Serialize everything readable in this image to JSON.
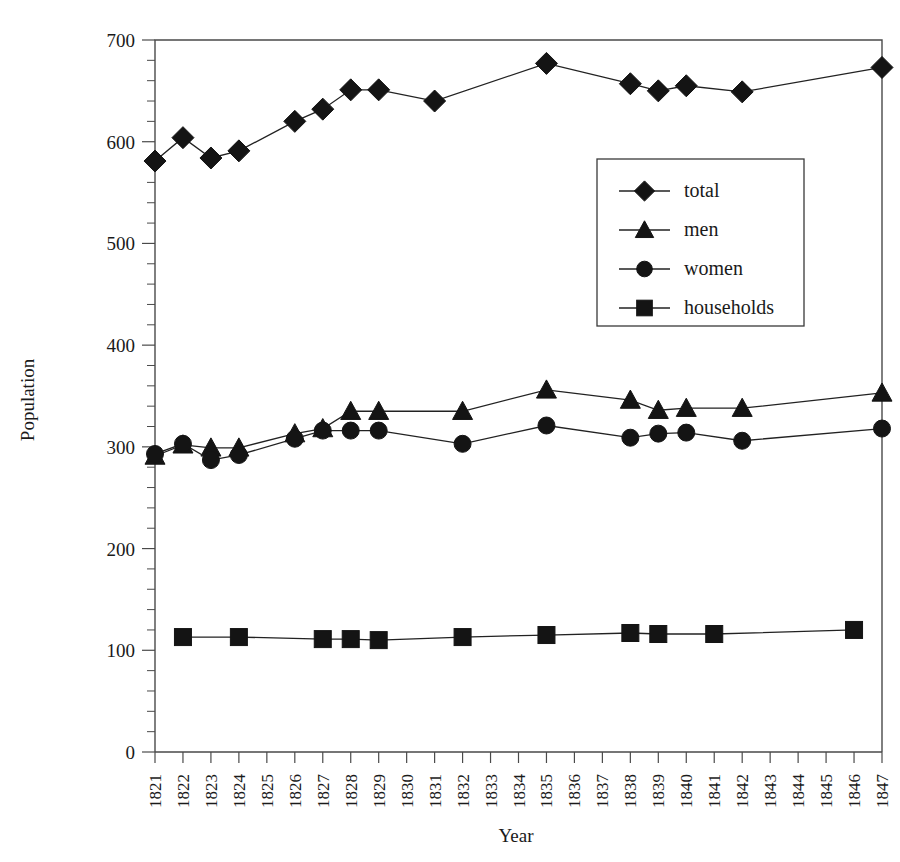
{
  "chart_data": {
    "type": "line",
    "title": "",
    "xlabel": "Year",
    "ylabel": "Population",
    "xlim": [
      1821,
      1847
    ],
    "ylim": [
      0,
      700
    ],
    "y_ticks": [
      0,
      100,
      200,
      300,
      400,
      500,
      600,
      700
    ],
    "y_tick_labels": [
      "0",
      "100",
      "200",
      "300",
      "400",
      "500",
      "600",
      "700"
    ],
    "y_minor_tick_step": 20,
    "x_ticks": [
      1821,
      1822,
      1823,
      1824,
      1825,
      1826,
      1827,
      1828,
      1829,
      1830,
      1831,
      1832,
      1833,
      1834,
      1835,
      1836,
      1837,
      1838,
      1839,
      1840,
      1841,
      1842,
      1843,
      1844,
      1845,
      1846,
      1847
    ],
    "x_tick_labels": [
      "1821",
      "1822",
      "1823",
      "1824",
      "1825",
      "1826",
      "1827",
      "1828",
      "1829",
      "1830",
      "1831",
      "1832",
      "1833",
      "1834",
      "1835",
      "1836",
      "1837",
      "1838",
      "1839",
      "1840",
      "1841",
      "1842",
      "1843",
      "1844",
      "1845",
      "1846",
      "1847"
    ],
    "x_tick_rotation": 90,
    "grid": false,
    "legend_position": "center-right",
    "series": [
      {
        "name": "total",
        "marker": "diamond",
        "points": [
          {
            "x": 1821,
            "y": 581
          },
          {
            "x": 1822,
            "y": 604
          },
          {
            "x": 1823,
            "y": 584
          },
          {
            "x": 1824,
            "y": 591
          },
          {
            "x": 1826,
            "y": 620
          },
          {
            "x": 1827,
            "y": 632
          },
          {
            "x": 1828,
            "y": 651
          },
          {
            "x": 1829,
            "y": 651
          },
          {
            "x": 1831,
            "y": 640
          },
          {
            "x": 1835,
            "y": 677
          },
          {
            "x": 1838,
            "y": 657
          },
          {
            "x": 1839,
            "y": 650
          },
          {
            "x": 1840,
            "y": 655
          },
          {
            "x": 1842,
            "y": 649
          },
          {
            "x": 1847,
            "y": 673
          }
        ]
      },
      {
        "name": "men",
        "marker": "triangle",
        "points": [
          {
            "x": 1821,
            "y": 291
          },
          {
            "x": 1822,
            "y": 302
          },
          {
            "x": 1823,
            "y": 299
          },
          {
            "x": 1824,
            "y": 299
          },
          {
            "x": 1826,
            "y": 313
          },
          {
            "x": 1827,
            "y": 318
          },
          {
            "x": 1828,
            "y": 335
          },
          {
            "x": 1829,
            "y": 335
          },
          {
            "x": 1832,
            "y": 335
          },
          {
            "x": 1835,
            "y": 356
          },
          {
            "x": 1838,
            "y": 346
          },
          {
            "x": 1839,
            "y": 336
          },
          {
            "x": 1840,
            "y": 338
          },
          {
            "x": 1842,
            "y": 338
          },
          {
            "x": 1847,
            "y": 353
          }
        ]
      },
      {
        "name": "women",
        "marker": "circle",
        "points": [
          {
            "x": 1821,
            "y": 293
          },
          {
            "x": 1822,
            "y": 303
          },
          {
            "x": 1823,
            "y": 287
          },
          {
            "x": 1824,
            "y": 292
          },
          {
            "x": 1826,
            "y": 308
          },
          {
            "x": 1827,
            "y": 316
          },
          {
            "x": 1828,
            "y": 316
          },
          {
            "x": 1829,
            "y": 316
          },
          {
            "x": 1832,
            "y": 303
          },
          {
            "x": 1835,
            "y": 321
          },
          {
            "x": 1838,
            "y": 309
          },
          {
            "x": 1839,
            "y": 313
          },
          {
            "x": 1840,
            "y": 314
          },
          {
            "x": 1842,
            "y": 306
          },
          {
            "x": 1847,
            "y": 318
          }
        ]
      },
      {
        "name": "households",
        "marker": "square",
        "points": [
          {
            "x": 1822,
            "y": 113
          },
          {
            "x": 1824,
            "y": 113
          },
          {
            "x": 1827,
            "y": 111
          },
          {
            "x": 1828,
            "y": 111
          },
          {
            "x": 1829,
            "y": 110
          },
          {
            "x": 1832,
            "y": 113
          },
          {
            "x": 1835,
            "y": 115
          },
          {
            "x": 1838,
            "y": 117
          },
          {
            "x": 1839,
            "y": 116
          },
          {
            "x": 1841,
            "y": 116
          },
          {
            "x": 1846,
            "y": 120
          }
        ]
      }
    ],
    "legend": [
      {
        "label": "total",
        "marker": "diamond"
      },
      {
        "label": "men",
        "marker": "triangle"
      },
      {
        "label": "women",
        "marker": "circle"
      },
      {
        "label": "households",
        "marker": "square"
      }
    ],
    "colors": {
      "marker": "#141414",
      "line": "#222222",
      "axis": "#4a4a4a",
      "text": "#1a1a1a",
      "background": "#ffffff"
    }
  }
}
